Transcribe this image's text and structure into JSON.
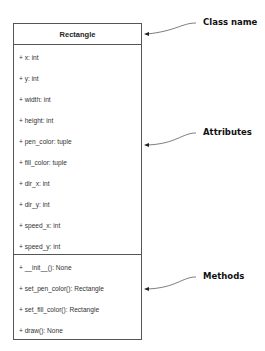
{
  "class_box": {
    "name": "Rectangle",
    "attributes": [
      "+ x: int",
      "+ y: int",
      "+ width: int",
      "+ height: int",
      "+ pen_color: tuple",
      "+ fill_color: tuple",
      "+ dir_x: int",
      "+ dir_y: int",
      "+ speed_x: int",
      "+ speed_y: int"
    ],
    "methods": [
      "+ __init__(): None",
      "+ set_pen_color(): Rectangle",
      "+ set_fill_color(): Rectangle",
      "+ draw(): None"
    ]
  },
  "callouts": {
    "class_name": "Class name",
    "attributes": "Attributes",
    "methods": "Methods"
  },
  "colors": {
    "border": "#555555",
    "text": "#222222",
    "arrow": "#444444"
  }
}
